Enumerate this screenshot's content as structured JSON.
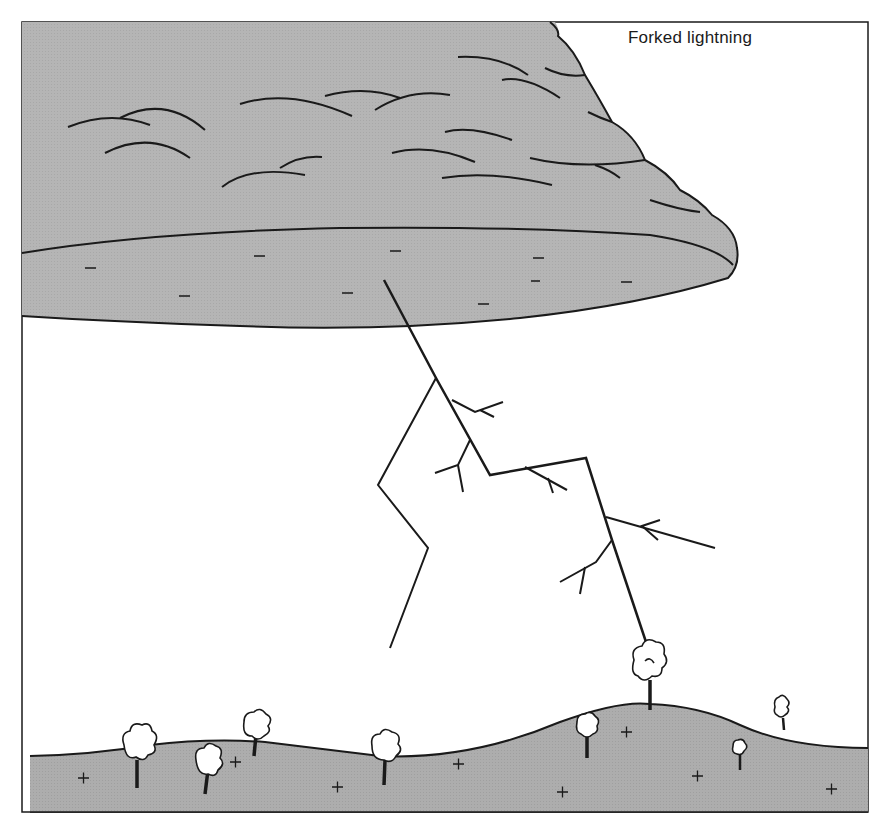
{
  "diagram": {
    "title": "Forked lightning",
    "colors": {
      "cloud_fill": "#b3b3b3",
      "ground_fill": "#ababab",
      "line": "#1a1a1a",
      "background": "#ffffff"
    },
    "cloud": {
      "charge_symbol": "−",
      "charge_count": 9,
      "charge_label": "negative charge"
    },
    "ground": {
      "charge_symbol": "+",
      "charge_count": 9,
      "charge_label": "positive charge",
      "tree_count": 9
    },
    "lightning": {
      "main_stroke": "strikes tallest tree on hilltop",
      "branches": "forked leader branches"
    }
  }
}
